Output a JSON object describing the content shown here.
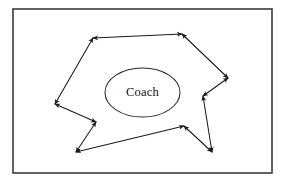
{
  "figure": {
    "kind": "diagram",
    "background_color": "#ffffff",
    "frame": {
      "name": "outer-border",
      "x": 13,
      "y": 9,
      "width": 259,
      "height": 164,
      "stroke_color": "#3a3a3a",
      "stroke_width": 1.6,
      "fill_color": "#ffffff"
    },
    "central_node": {
      "label": "Coach",
      "shape": "ellipse",
      "cx": 142.5,
      "cy": 92.5,
      "rx": 37.5,
      "ry": 24.5,
      "stroke_color": "#2a2a2a",
      "text_color": "#111111"
    },
    "flow": {
      "stroke_color": "#1a1a1a",
      "stroke_width": 1.05,
      "arrow_style": "double-headed",
      "vertices": [
        {
          "id": "v1",
          "x": 93,
          "y": 38,
          "note": "upper-left corner of loop"
        },
        {
          "id": "v2",
          "x": 182,
          "y": 34,
          "note": "upper-right corner of loop"
        },
        {
          "id": "v3",
          "x": 228,
          "y": 78,
          "note": "right outer point"
        },
        {
          "id": "v4",
          "x": 203,
          "y": 96,
          "note": "right inner notch"
        },
        {
          "id": "v5",
          "x": 212,
          "y": 152,
          "note": "lower-right point"
        },
        {
          "id": "v6",
          "x": 184,
          "y": 126,
          "note": "lower inner notch"
        },
        {
          "id": "v7",
          "x": 76,
          "y": 152,
          "note": "lower-left point"
        },
        {
          "id": "v8",
          "x": 96,
          "y": 122,
          "note": "left inner notch"
        },
        {
          "id": "v9",
          "x": 55,
          "y": 104,
          "note": "left outer point"
        }
      ],
      "segments": [
        {
          "id": "s1",
          "from": "v1",
          "to": "v2",
          "heads": "both"
        },
        {
          "id": "s2",
          "from": "v2",
          "to": "v3",
          "heads": "both"
        },
        {
          "id": "s3",
          "from": "v3",
          "to": "v4",
          "heads": "both"
        },
        {
          "id": "s4",
          "from": "v4",
          "to": "v5",
          "heads": "both"
        },
        {
          "id": "s5",
          "from": "v5",
          "to": "v6",
          "heads": "both"
        },
        {
          "id": "s6",
          "from": "v6",
          "to": "v7",
          "heads": "both"
        },
        {
          "id": "s7",
          "from": "v7",
          "to": "v8",
          "heads": "both"
        },
        {
          "id": "s8",
          "from": "v8",
          "to": "v9",
          "heads": "both"
        },
        {
          "id": "s9",
          "from": "v9",
          "to": "v1",
          "heads": "both"
        }
      ]
    }
  }
}
